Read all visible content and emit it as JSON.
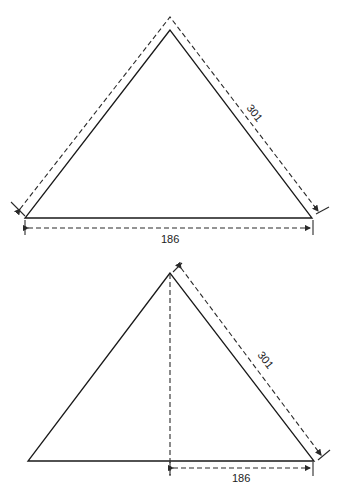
{
  "figures": [
    {
      "name": "triangle-perimeter",
      "labels": {
        "side": "301",
        "base": "186"
      }
    },
    {
      "name": "triangle-half-base",
      "labels": {
        "side": "301",
        "base": "186"
      }
    }
  ],
  "caption": ""
}
